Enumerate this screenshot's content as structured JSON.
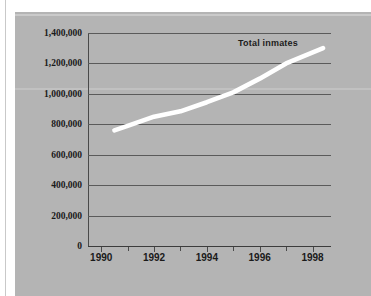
{
  "figure": {
    "background_color": "#ffffff",
    "panel_color": "#b4b4b4",
    "line_color": "#ffffff",
    "text_color": "#1a1a1a",
    "gridline_color": "#5a5a5a"
  },
  "chart_data": {
    "type": "line",
    "title": "",
    "subtitle": "",
    "xlabel": "",
    "ylabel": "",
    "grid": true,
    "legend_position": "inline-right",
    "xlim": [
      1989.5,
      1998.7
    ],
    "ylim": [
      0,
      1400000
    ],
    "ytick_labels": [
      "1,400,000",
      "1,200,000",
      "1,000,000",
      "800,000",
      "600,000",
      "400,000",
      "200,000",
      "0"
    ],
    "ytick_values": [
      1400000,
      1200000,
      1000000,
      800000,
      600000,
      400000,
      200000,
      0
    ],
    "xtick_labels": [
      "1990",
      "1992",
      "1994",
      "1996",
      "1998"
    ],
    "xtick_values": [
      1990,
      1992,
      1994,
      1996,
      1998
    ],
    "xminor_values": [
      1991,
      1993,
      1995,
      1997
    ],
    "series": [
      {
        "name": "Total inmates",
        "color": "#ffffff",
        "x": [
          1990.5,
          1991,
          1992,
          1993,
          1994,
          1995,
          1996,
          1997,
          1998.4
        ],
        "values": [
          760000,
          790000,
          850000,
          885000,
          945000,
          1010000,
          1100000,
          1200000,
          1300000
        ]
      }
    ],
    "annotations": [
      {
        "text": "Total inmates",
        "x": 1996.4,
        "y": 1340000
      }
    ]
  }
}
